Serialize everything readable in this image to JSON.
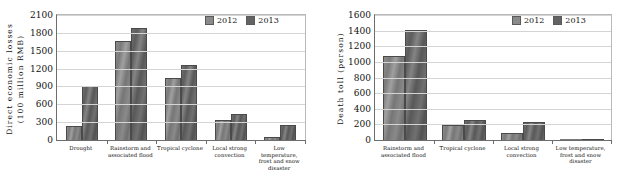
{
  "figure": {
    "legend": {
      "series": [
        {
          "label": "2012",
          "color": "#8a8a8a"
        },
        {
          "label": "2013",
          "color": "#636363"
        }
      ]
    }
  },
  "chart_data": [
    {
      "type": "bar",
      "title": "",
      "xlabel": "",
      "ylabel": "Direct economic losses (100 million RMB)",
      "ylabel_line1": "Direct economic losses",
      "ylabel_line2": "(100 million RMB)",
      "ylim": [
        0,
        2100
      ],
      "yticks": [
        0,
        300,
        600,
        900,
        1200,
        1500,
        1800,
        2100
      ],
      "ytick_labels": [
        "0",
        "300",
        "600",
        "900",
        "1200",
        "1500",
        "1800",
        "2100"
      ],
      "grid": true,
      "legend_position": "top-right",
      "categories": [
        "Drought",
        "Rainstorm and associated flood",
        "Tropical cyclone",
        "Local strong convection",
        "Low temperature, frost and snow disaster"
      ],
      "series": [
        {
          "name": "2012",
          "values": [
            240,
            1660,
            1045,
            330,
            45
          ]
        },
        {
          "name": "2013",
          "values": [
            905,
            1890,
            1255,
            440,
            250
          ]
        }
      ]
    },
    {
      "type": "bar",
      "title": "",
      "xlabel": "",
      "ylabel": "Death toll (person)",
      "ylabel_line1": "Death toll (person)",
      "ylabel_line2": "",
      "ylim": [
        0,
        1600
      ],
      "yticks": [
        0,
        200,
        400,
        600,
        800,
        1000,
        1200,
        1400,
        1600
      ],
      "ytick_labels": [
        "0",
        "200",
        "400",
        "600",
        "800",
        "1000",
        "1200",
        "1400",
        "1600"
      ],
      "grid": true,
      "legend_position": "top-right",
      "categories": [
        "Rainstorm and associated flood",
        "Tropical cyclone",
        "Local strong convection",
        "Low temperature, frost and snow disaster"
      ],
      "series": [
        {
          "name": "2012",
          "values": [
            1070,
            195,
            85,
            0
          ]
        },
        {
          "name": "2013",
          "values": [
            1410,
            250,
            230,
            10
          ]
        }
      ]
    }
  ]
}
